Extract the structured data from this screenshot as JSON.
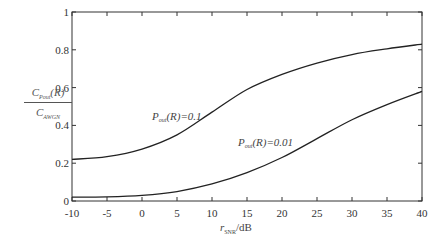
{
  "chart_data": {
    "type": "line",
    "title": "",
    "xlabel": "r_SNR/dB",
    "ylabel": "C_Pout(R) / C_AWGN",
    "xlim": [
      -10,
      40
    ],
    "ylim": [
      0,
      1
    ],
    "xticks": [
      -10,
      -5,
      0,
      5,
      10,
      15,
      20,
      25,
      30,
      35,
      40
    ],
    "yticks": [
      0,
      0.2,
      0.4,
      0.6,
      0.8,
      1
    ],
    "ytick_labels": [
      "0",
      "0.2",
      "0.4",
      "0.6",
      "0.8",
      "1"
    ],
    "grid": false,
    "legend": "inline annotations",
    "x": [
      -10,
      -5,
      0,
      5,
      10,
      15,
      20,
      25,
      30,
      35,
      40
    ],
    "series": [
      {
        "name": "P_out(R)=0.1",
        "values": [
          0.22,
          0.235,
          0.275,
          0.35,
          0.47,
          0.59,
          0.67,
          0.73,
          0.775,
          0.805,
          0.83
        ]
      },
      {
        "name": "P_out(R)=0.01",
        "values": [
          0.02,
          0.022,
          0.03,
          0.05,
          0.09,
          0.15,
          0.23,
          0.33,
          0.43,
          0.51,
          0.58
        ]
      }
    ],
    "annotations": [
      {
        "text": "P_out(R)=0.1",
        "x": 4,
        "y": 0.43
      },
      {
        "text": "P_out(R)=0.01",
        "x": 16,
        "y": 0.31
      }
    ]
  },
  "labels": {
    "y_num_main": "C",
    "y_num_sub": "Pout",
    "y_num_tail": "(R)",
    "y_den_main": "C",
    "y_den_sub": "AWGN",
    "x_main": "r",
    "x_sub": "SNR",
    "x_tail": "/dB",
    "ann1_p": "P",
    "ann1_sub": "out",
    "ann1_tail": "(R)=0.1",
    "ann2_p": "P",
    "ann2_sub": "out",
    "ann2_tail": "(R)=0.01"
  }
}
